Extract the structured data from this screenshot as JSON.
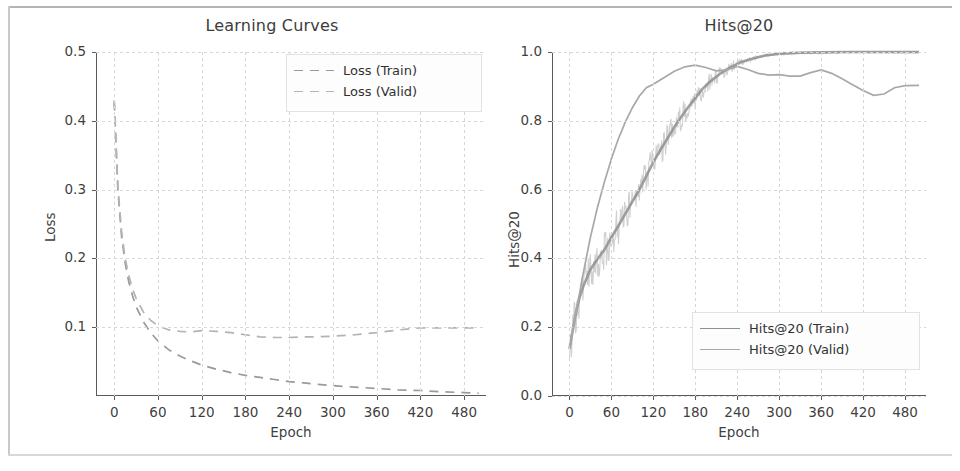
{
  "figure": {
    "background": "#ffffff",
    "axis_color": "#5a5a5a",
    "grid_color": "#d6d6de"
  },
  "chart_data": [
    {
      "type": "line",
      "panel": "left",
      "title": "Learning Curves",
      "xlabel": "Epoch",
      "ylabel": "Loss",
      "xlim": [
        -25,
        510
      ],
      "ylim": [
        0.0,
        0.5
      ],
      "grid": true,
      "legend_position": "upper right",
      "xticks": [
        0,
        60,
        120,
        180,
        240,
        300,
        360,
        420,
        480
      ],
      "yticks": [
        0.1,
        0.2,
        0.3,
        0.4,
        0.5
      ],
      "ytick_labels": [
        "0.1",
        "0.2",
        "0.3",
        "0.4",
        "0.5"
      ],
      "xtick_labels": [
        "0",
        "60",
        "120",
        "180",
        "240",
        "300",
        "360",
        "420",
        "480"
      ],
      "series": [
        {
          "name": "Loss (Train)",
          "style": "dashed",
          "color": "#9a9a9a",
          "x": [
            0,
            5,
            10,
            15,
            20,
            25,
            30,
            40,
            50,
            60,
            75,
            90,
            105,
            120,
            140,
            160,
            180,
            200,
            220,
            240,
            260,
            280,
            300,
            330,
            360,
            390,
            420,
            450,
            480,
            500
          ],
          "y": [
            0.428,
            0.3,
            0.233,
            0.193,
            0.166,
            0.146,
            0.13,
            0.108,
            0.092,
            0.08,
            0.067,
            0.058,
            0.051,
            0.045,
            0.039,
            0.034,
            0.03,
            0.027,
            0.024,
            0.021,
            0.019,
            0.017,
            0.015,
            0.013,
            0.011,
            0.009,
            0.008,
            0.006,
            0.005,
            0.004
          ]
        },
        {
          "name": "Loss (Valid)",
          "style": "dashed",
          "color": "#b3b3b3",
          "x": [
            0,
            5,
            10,
            15,
            20,
            25,
            30,
            40,
            50,
            60,
            75,
            90,
            105,
            120,
            140,
            160,
            180,
            200,
            220,
            240,
            260,
            280,
            300,
            330,
            360,
            390,
            420,
            450,
            480,
            500
          ],
          "y": [
            0.43,
            0.305,
            0.24,
            0.2,
            0.175,
            0.156,
            0.142,
            0.122,
            0.11,
            0.102,
            0.096,
            0.094,
            0.093,
            0.095,
            0.094,
            0.092,
            0.089,
            0.086,
            0.085,
            0.085,
            0.086,
            0.086,
            0.087,
            0.089,
            0.092,
            0.096,
            0.099,
            0.099,
            0.099,
            0.099
          ]
        }
      ]
    },
    {
      "type": "line",
      "panel": "right",
      "title": "Hits@20",
      "xlabel": "Epoch",
      "ylabel": "Hits@20",
      "xlim": [
        -25,
        510
      ],
      "ylim": [
        0.0,
        1.0
      ],
      "grid": true,
      "legend_position": "lower right",
      "xticks": [
        0,
        60,
        120,
        180,
        240,
        300,
        360,
        420,
        480
      ],
      "yticks": [
        0.0,
        0.2,
        0.4,
        0.6,
        0.8,
        1.0
      ],
      "ytick_labels": [
        "0.0",
        "0.2",
        "0.4",
        "0.6",
        "0.8",
        "1.0"
      ],
      "xtick_labels": [
        "0",
        "60",
        "120",
        "180",
        "240",
        "300",
        "360",
        "420",
        "480"
      ],
      "series": [
        {
          "name": "Hits@20 (Train)",
          "style": "solid-noisy",
          "color": "#8f8f8f",
          "x": [
            0,
            5,
            10,
            15,
            20,
            30,
            40,
            50,
            60,
            70,
            80,
            90,
            100,
            110,
            120,
            130,
            140,
            150,
            160,
            170,
            180,
            190,
            200,
            215,
            230,
            245,
            260,
            280,
            300,
            330,
            360,
            400,
            440,
            480,
            500
          ],
          "y": [
            0.137,
            0.195,
            0.25,
            0.29,
            0.32,
            0.368,
            0.398,
            0.425,
            0.462,
            0.495,
            0.53,
            0.565,
            0.6,
            0.64,
            0.68,
            0.715,
            0.748,
            0.782,
            0.812,
            0.84,
            0.866,
            0.892,
            0.912,
            0.936,
            0.955,
            0.97,
            0.98,
            0.99,
            0.995,
            0.998,
            0.999,
            1.0,
            1.0,
            1.0,
            1.0
          ]
        },
        {
          "name": "Hits@20 (Valid)",
          "style": "solid",
          "color": "#a8a8a8",
          "x": [
            0,
            10,
            20,
            30,
            40,
            50,
            60,
            70,
            80,
            90,
            100,
            110,
            120,
            135,
            150,
            165,
            180,
            195,
            210,
            225,
            240,
            255,
            270,
            285,
            300,
            315,
            330,
            345,
            360,
            375,
            390,
            405,
            420,
            435,
            450,
            465,
            480,
            500
          ],
          "y": [
            0.14,
            0.25,
            0.36,
            0.462,
            0.548,
            0.622,
            0.69,
            0.748,
            0.797,
            0.838,
            0.872,
            0.896,
            0.906,
            0.925,
            0.944,
            0.957,
            0.962,
            0.955,
            0.945,
            0.948,
            0.958,
            0.949,
            0.938,
            0.933,
            0.934,
            0.93,
            0.93,
            0.94,
            0.948,
            0.938,
            0.922,
            0.905,
            0.888,
            0.874,
            0.878,
            0.896,
            0.902,
            0.903
          ]
        }
      ]
    }
  ],
  "left_panel": {
    "title": "Learning Curves",
    "xlabel": "Epoch",
    "ylabel": "Loss",
    "xtick_labels": [
      "0",
      "60",
      "120",
      "180",
      "240",
      "300",
      "360",
      "420",
      "480"
    ],
    "ytick_labels": [
      "0.1",
      "0.2",
      "0.3",
      "0.4",
      "0.5"
    ],
    "legend": [
      {
        "label": "Loss (Train)",
        "key": "dashed-line-key"
      },
      {
        "label": "Loss (Valid)",
        "key": "dashed-line-key"
      }
    ]
  },
  "right_panel": {
    "title": "Hits@20",
    "xlabel": "Epoch",
    "ylabel": "Hits@20",
    "xtick_labels": [
      "0",
      "60",
      "120",
      "180",
      "240",
      "300",
      "360",
      "420",
      "480"
    ],
    "ytick_labels": [
      "0.0",
      "0.2",
      "0.4",
      "0.6",
      "0.8",
      "1.0"
    ],
    "legend": [
      {
        "label": "Hits@20 (Train)",
        "key": "solid-line-key"
      },
      {
        "label": "Hits@20 (Valid)",
        "key": "solid-line-key"
      }
    ]
  }
}
